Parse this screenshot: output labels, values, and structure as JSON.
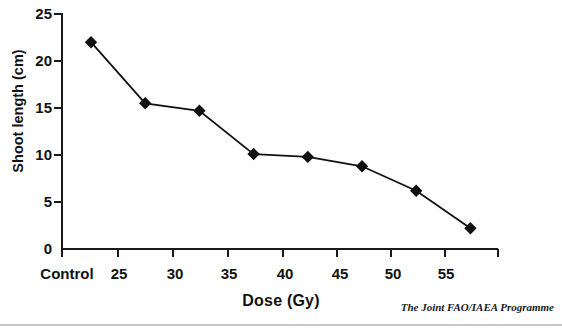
{
  "chart_data": {
    "type": "line",
    "title": "",
    "xlabel": "Dose (Gy)",
    "ylabel": "Shoot length (cm)",
    "categories": [
      "Control",
      "25",
      "30",
      "35",
      "40",
      "45",
      "50",
      "55"
    ],
    "x": [
      0,
      25,
      30,
      35,
      40,
      45,
      50,
      55
    ],
    "values": [
      22.0,
      15.5,
      14.7,
      10.1,
      9.8,
      8.8,
      6.2,
      2.2
    ],
    "series": [
      {
        "name": "Shoot length",
        "values": [
          22.0,
          15.5,
          14.7,
          10.1,
          9.8,
          8.8,
          6.2,
          2.2
        ],
        "marker": "diamond",
        "color": "#111111"
      }
    ],
    "ylim": [
      0,
      25
    ],
    "yticks": [
      0,
      5,
      10,
      15,
      20,
      25
    ],
    "ytick_labels": [
      "0",
      "5",
      "10",
      "15",
      "20",
      "25"
    ],
    "xtick_labels": [
      "Control",
      "25",
      "30",
      "35",
      "40",
      "45",
      "50",
      "55"
    ],
    "grid": false,
    "legend": false,
    "legend_position": "none"
  },
  "axes": {
    "y_title": "Shoot length (cm)",
    "x_title": "Dose (Gy)"
  },
  "footer": {
    "credit": "The Joint FAO/IAEA Programme"
  },
  "colors": {
    "axis": "#1a1a1a",
    "series": "#111111",
    "background": "#ffffff",
    "rule": "#c9c9c9"
  }
}
